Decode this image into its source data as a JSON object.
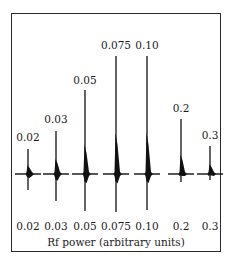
{
  "figure": {
    "xlabel": "Rf power (arbitrary units)",
    "baseline_y": 174,
    "peaks": [
      {
        "label": "0.02",
        "x": 28,
        "tip": 149,
        "bottom": 190,
        "label_y": 141,
        "axis_label": "0.02"
      },
      {
        "label": "0.03",
        "x": 56,
        "tip": 131,
        "bottom": 201,
        "label_y": 123,
        "axis_label": "0.03"
      },
      {
        "label": "0.05",
        "x": 85,
        "tip": 90,
        "bottom": 211,
        "label_y": 84,
        "axis_label": "0.05"
      },
      {
        "label": "0.075",
        "x": 116,
        "tip": 56,
        "bottom": 212,
        "label_y": 49,
        "axis_label": "0.075"
      },
      {
        "label": "0.10",
        "x": 147,
        "tip": 56,
        "bottom": 210,
        "label_y": 49,
        "axis_label": "0.10"
      },
      {
        "label": "0.2",
        "x": 181,
        "tip": 119,
        "bottom": 182,
        "label_y": 112,
        "axis_label": "0.2"
      },
      {
        "label": "0.3",
        "x": 210,
        "tip": 146,
        "bottom": 180,
        "label_y": 139,
        "axis_label": "0.3"
      }
    ]
  }
}
